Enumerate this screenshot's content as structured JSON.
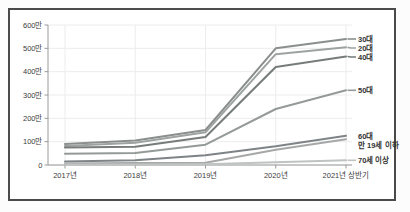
{
  "chart_data": {
    "type": "line",
    "title": "",
    "x_categories": [
      "2017년",
      "2018년",
      "2019년",
      "2020년",
      "2021년 상반기"
    ],
    "y_ticks": [
      "600만",
      "500만",
      "400만",
      "300만",
      "200만",
      "100만",
      "0"
    ],
    "y_unit": "만",
    "ylim": [
      0,
      600
    ],
    "grid": true,
    "legend_position": "right-inline-labels",
    "axis_color": "#9a9a9a",
    "grid_color": "#ececec",
    "label_color": "#3c3c3c",
    "series": [
      {
        "name": "30대",
        "values": [
          90,
          105,
          150,
          500,
          540
        ],
        "color": "#8a8f8d"
      },
      {
        "name": "20대",
        "values": [
          82,
          95,
          140,
          475,
          505
        ],
        "color": "#9da3a0"
      },
      {
        "name": "40대",
        "values": [
          75,
          78,
          120,
          420,
          465
        ],
        "color": "#767c79"
      },
      {
        "name": "50대",
        "values": [
          48,
          52,
          87,
          240,
          320
        ],
        "color": "#949a97"
      },
      {
        "name": "60대",
        "values": [
          15,
          20,
          42,
          80,
          125
        ],
        "color": "#7e8486"
      },
      {
        "name": "만 19세 이하",
        "values": [
          7,
          8,
          10,
          65,
          110
        ],
        "color": "#a5a8a6"
      },
      {
        "name": "70세 이상",
        "values": [
          2,
          2,
          3,
          12,
          20
        ],
        "color": "#bfc3c1"
      }
    ]
  }
}
